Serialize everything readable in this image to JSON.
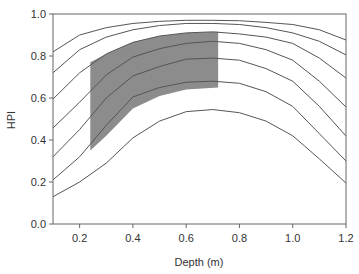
{
  "chart_data": {
    "type": "line",
    "title": "",
    "xlabel": "Depth (m)",
    "ylabel": "HPI",
    "xlim": [
      0.1,
      1.2
    ],
    "ylim": [
      0.0,
      1.0
    ],
    "xticks": [
      0.2,
      0.4,
      0.6,
      0.8,
      1.0,
      1.2
    ],
    "xtick_labels": [
      "0.2",
      "0.4",
      "0.6",
      "0.8",
      "1.0",
      "1.2"
    ],
    "yticks": [
      0.0,
      0.2,
      0.4,
      0.6,
      0.8,
      1.0
    ],
    "ytick_labels": [
      "0.0",
      "0.2",
      "0.4",
      "0.6",
      "0.8",
      "1.0"
    ],
    "grid": false,
    "legend": null,
    "x": [
      0.1,
      0.2,
      0.3,
      0.4,
      0.5,
      0.6,
      0.7,
      0.8,
      0.9,
      1.0,
      1.1,
      1.2
    ],
    "series": [
      {
        "name": "curve-1",
        "values": [
          0.82,
          0.9,
          0.935,
          0.955,
          0.965,
          0.97,
          0.97,
          0.968,
          0.96,
          0.95,
          0.925,
          0.876
        ]
      },
      {
        "name": "curve-2",
        "values": [
          0.72,
          0.83,
          0.89,
          0.925,
          0.945,
          0.955,
          0.955,
          0.95,
          0.935,
          0.91,
          0.87,
          0.805
        ]
      },
      {
        "name": "curve-3",
        "values": [
          0.595,
          0.72,
          0.81,
          0.865,
          0.895,
          0.91,
          0.915,
          0.905,
          0.89,
          0.86,
          0.79,
          0.695
        ]
      },
      {
        "name": "curve-4",
        "values": [
          0.457,
          0.58,
          0.71,
          0.795,
          0.835,
          0.86,
          0.87,
          0.86,
          0.83,
          0.78,
          0.68,
          0.557
        ]
      },
      {
        "name": "curve-5",
        "values": [
          0.32,
          0.45,
          0.6,
          0.705,
          0.75,
          0.785,
          0.79,
          0.78,
          0.74,
          0.68,
          0.56,
          0.419
        ]
      },
      {
        "name": "curve-6",
        "values": [
          0.21,
          0.32,
          0.47,
          0.605,
          0.65,
          0.675,
          0.68,
          0.67,
          0.63,
          0.56,
          0.43,
          0.3
        ]
      },
      {
        "name": "curve-7",
        "values": [
          0.13,
          0.2,
          0.29,
          0.41,
          0.49,
          0.535,
          0.545,
          0.53,
          0.49,
          0.42,
          0.31,
          0.195
        ]
      }
    ],
    "shaded_region": {
      "x_range": [
        0.24,
        0.72
      ],
      "upper": {
        "x": [
          0.24,
          0.3,
          0.4,
          0.5,
          0.6,
          0.72
        ],
        "y": [
          0.77,
          0.81,
          0.865,
          0.895,
          0.91,
          0.915
        ]
      },
      "lower": {
        "x": [
          0.24,
          0.3,
          0.4,
          0.5,
          0.6,
          0.72
        ],
        "y": [
          0.35,
          0.42,
          0.55,
          0.61,
          0.64,
          0.65
        ]
      },
      "color": "#8c8c8c"
    },
    "line_color": "#555555"
  }
}
